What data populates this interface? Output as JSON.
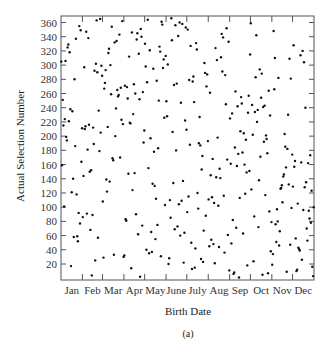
{
  "chart_data": {
    "type": "scatter",
    "title": "",
    "xlabel": "Birth Date",
    "ylabel": "Actual Selection Number",
    "caption": "(a)",
    "x_tick_labels": [
      "Jan",
      "Feb",
      "Mar",
      "Apr",
      "May",
      "June",
      "July",
      "Aug",
      "Sep",
      "Oct",
      "Nov",
      "Dec"
    ],
    "y_ticks": [
      20,
      40,
      60,
      80,
      100,
      120,
      140,
      160,
      180,
      200,
      220,
      240,
      260,
      280,
      300,
      320,
      340,
      360
    ],
    "xlim": [
      1,
      366
    ],
    "ylim": [
      0,
      366
    ],
    "grid": false,
    "legend": null,
    "marker_color": "#111111",
    "series": [
      {
        "name": "Jan",
        "x_month": 1,
        "values": [
          305,
          159,
          251,
          215,
          101,
          224,
          306,
          199,
          194,
          325,
          329,
          221,
          318,
          238,
          17,
          121,
          235,
          140,
          58,
          280,
          186,
          337,
          118,
          59,
          52,
          92,
          355,
          77,
          349,
          164,
          211
        ]
      },
      {
        "name": "Feb",
        "x_month": 2,
        "values": [
          86,
          144,
          297,
          210,
          214,
          347,
          91,
          181,
          338,
          216,
          150,
          68,
          152,
          4,
          89,
          212,
          189,
          292,
          25,
          302,
          363,
          290,
          57,
          236,
          179,
          365,
          205,
          299,
          285
        ]
      },
      {
        "name": "Mar",
        "x_month": 3,
        "values": [
          108,
          29,
          267,
          275,
          293,
          139,
          122,
          213,
          317,
          323,
          136,
          300,
          259,
          354,
          169,
          166,
          33,
          332,
          200,
          239,
          334,
          265,
          256,
          258,
          343,
          170,
          268,
          223,
          362,
          217,
          30
        ]
      },
      {
        "name": "Apr",
        "x_month": 4,
        "values": [
          32,
          271,
          83,
          81,
          269,
          253,
          147,
          312,
          219,
          218,
          14,
          346,
          124,
          231,
          273,
          148,
          260,
          90,
          336,
          345,
          62,
          316,
          252,
          2,
          351,
          340,
          74,
          262,
          191,
          208
        ]
      },
      {
        "name": "May",
        "x_month": 5,
        "values": [
          330,
          298,
          40,
          276,
          364,
          155,
          35,
          321,
          197,
          65,
          37,
          133,
          295,
          178,
          130,
          55,
          112,
          278,
          75,
          183,
          250,
          326,
          319,
          31,
          361,
          357,
          296,
          308,
          226,
          103,
          313
        ]
      },
      {
        "name": "June",
        "x_month": 6,
        "values": [
          249,
          228,
          301,
          20,
          28,
          110,
          85,
          366,
          335,
          206,
          134,
          272,
          69,
          356,
          180,
          274,
          73,
          341,
          104,
          360,
          60,
          247,
          109,
          358,
          137,
          22,
          64,
          222,
          353,
          209
        ]
      },
      {
        "name": "July",
        "x_month": 7,
        "values": [
          93,
          350,
          115,
          279,
          188,
          327,
          50,
          13,
          277,
          284,
          248,
          15,
          42,
          331,
          322,
          120,
          98,
          190,
          227,
          187,
          27,
          153,
          172,
          23,
          67,
          303,
          289,
          88,
          270,
          287,
          193
        ]
      },
      {
        "name": "Aug",
        "x_month": 8,
        "values": [
          111,
          45,
          261,
          145,
          54,
          114,
          168,
          48,
          106,
          21,
          324,
          142,
          307,
          198,
          102,
          44,
          154,
          141,
          311,
          344,
          291,
          339,
          116,
          36,
          286,
          245,
          352,
          167,
          61,
          333,
          11
        ]
      },
      {
        "name": "Sep",
        "x_month": 9,
        "values": [
          225,
          161,
          49,
          232,
          82,
          6,
          8,
          184,
          263,
          71,
          158,
          242,
          175,
          1,
          113,
          207,
          255,
          246,
          177,
          63,
          204,
          160,
          119,
          195,
          149,
          18,
          233,
          257,
          151,
          315
        ]
      },
      {
        "name": "Oct",
        "x_month": 10,
        "values": [
          359,
          125,
          244,
          202,
          24,
          87,
          234,
          283,
          342,
          220,
          237,
          72,
          138,
          294,
          171,
          254,
          288,
          5,
          241,
          192,
          243,
          117,
          201,
          196,
          176,
          7,
          264,
          94,
          229,
          38,
          79
        ]
      },
      {
        "name": "Nov",
        "x_month": 11,
        "values": [
          19,
          34,
          348,
          266,
          310,
          76,
          51,
          97,
          80,
          282,
          46,
          66,
          126,
          127,
          131,
          107,
          143,
          146,
          203,
          185,
          156,
          9,
          182,
          230,
          132,
          309,
          47,
          281,
          99,
          174
        ]
      },
      {
        "name": "Dec",
        "x_month": 12,
        "values": [
          129,
          328,
          157,
          165,
          56,
          10,
          12,
          105,
          43,
          41,
          39,
          314,
          163,
          26,
          320,
          96,
          304,
          128,
          240,
          135,
          70,
          53,
          162,
          95,
          84,
          173,
          78,
          123,
          16,
          3,
          100
        ]
      }
    ]
  },
  "layout": {
    "plot": {
      "left": 61,
      "top": 16,
      "right": 314,
      "bottom": 280
    },
    "y_px_at_20": 264,
    "y_px_at_360": 22.5
  }
}
